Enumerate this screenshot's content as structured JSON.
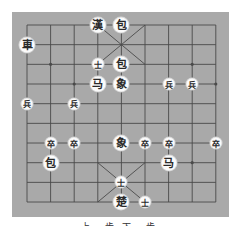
{
  "board": {
    "type": "xiangqi",
    "columns": 9,
    "rows": 10,
    "colors": {
      "background": "#a9a9a9",
      "line": "#4a4a4a",
      "piece_face": "#fbfbfb",
      "piece_text": "#2a2a2a"
    },
    "pieces": [
      {
        "label": "漢",
        "col": 3,
        "row": 0,
        "size": "big",
        "role": "general"
      },
      {
        "label": "包",
        "col": 4,
        "row": 0,
        "size": "big",
        "role": "cannon"
      },
      {
        "label": "車",
        "col": 0,
        "row": 1,
        "size": "big",
        "role": "chariot"
      },
      {
        "label": "士",
        "col": 3,
        "row": 2,
        "size": "small",
        "role": "advisor"
      },
      {
        "label": "包",
        "col": 4,
        "row": 2,
        "size": "big",
        "role": "cannon"
      },
      {
        "label": "马",
        "col": 3,
        "row": 3,
        "size": "big",
        "role": "horse"
      },
      {
        "label": "象",
        "col": 4,
        "row": 3,
        "size": "big",
        "role": "elephant"
      },
      {
        "label": "兵",
        "col": 6,
        "row": 3,
        "size": "small",
        "role": "soldier"
      },
      {
        "label": "兵",
        "col": 7,
        "row": 3,
        "size": "small",
        "role": "soldier"
      },
      {
        "label": "兵",
        "col": 0,
        "row": 4,
        "size": "small",
        "role": "soldier"
      },
      {
        "label": "兵",
        "col": 2,
        "row": 4,
        "size": "small",
        "role": "soldier"
      },
      {
        "label": "卒",
        "col": 1,
        "row": 6,
        "size": "small",
        "role": "soldier"
      },
      {
        "label": "卒",
        "col": 2,
        "row": 6,
        "size": "small",
        "role": "soldier"
      },
      {
        "label": "象",
        "col": 4,
        "row": 6,
        "size": "big",
        "role": "elephant"
      },
      {
        "label": "卒",
        "col": 5,
        "row": 6,
        "size": "small",
        "role": "soldier"
      },
      {
        "label": "卒",
        "col": 6,
        "row": 6,
        "size": "small",
        "role": "soldier"
      },
      {
        "label": "卒",
        "col": 8,
        "row": 6,
        "size": "small",
        "role": "soldier"
      },
      {
        "label": "包",
        "col": 1,
        "row": 7,
        "size": "big",
        "role": "cannon"
      },
      {
        "label": "马",
        "col": 6,
        "row": 7,
        "size": "big",
        "role": "horse"
      },
      {
        "label": "士",
        "col": 4,
        "row": 8,
        "size": "small",
        "role": "advisor"
      },
      {
        "label": "楚",
        "col": 4,
        "row": 9,
        "size": "big",
        "role": "general"
      },
      {
        "label": "士",
        "col": 5,
        "row": 9,
        "size": "small",
        "role": "advisor"
      }
    ],
    "star_points": [
      {
        "col": 1,
        "row": 2
      },
      {
        "col": 7,
        "row": 2
      },
      {
        "col": 2,
        "row": 3
      },
      {
        "col": 8,
        "row": 3
      },
      {
        "col": 7,
        "row": 7
      }
    ]
  },
  "caption": "上一步 下一步"
}
